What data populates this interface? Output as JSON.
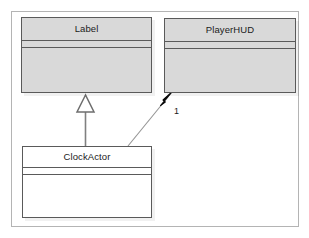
{
  "diagram": {
    "type": "uml-class-diagram",
    "canvas": {
      "background_color": "#ffffff",
      "border_color": "#b4b4b4"
    },
    "classes": [
      {
        "id": "label",
        "name": "Label",
        "fill_color": "#d9d9d9",
        "border_color": "#5a5a5a",
        "attributes": [],
        "operations": []
      },
      {
        "id": "playerhud",
        "name": "PlayerHUD",
        "fill_color": "#d9d9d9",
        "border_color": "#5a5a5a",
        "attributes": [],
        "operations": []
      },
      {
        "id": "clockactor",
        "name": "ClockActor",
        "fill_color": "#ffffff",
        "border_color": "#5a5a5a",
        "attributes": [],
        "operations": []
      }
    ],
    "relationships": [
      {
        "id": "generalization-clockactor-label",
        "kind": "generalization",
        "from": "ClockActor",
        "to": "Label",
        "arrow": "hollow-triangle",
        "line_color": "#787878",
        "arrow_fill": "#ffffff",
        "multiplicity": ""
      },
      {
        "id": "association-clockactor-playerhud",
        "kind": "association",
        "from": "ClockActor",
        "to": "PlayerHUD",
        "arrow": "filled-arrowhead",
        "line_color": "#8c8c8c",
        "arrow_fill": "#0a0a0a",
        "multiplicity": "1"
      }
    ]
  }
}
